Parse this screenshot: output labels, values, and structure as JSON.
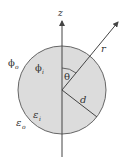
{
  "diagram": {
    "type": "sphere-in-dielectric",
    "colors": {
      "sphere_fill": "#dcdcdc",
      "stroke": "#555555",
      "text": "#333333"
    },
    "labels": {
      "z_axis": "z",
      "r_vector": "r",
      "theta": "θ",
      "radius": "d",
      "phi_outside": "ϕ",
      "phi_outside_sub": "o",
      "phi_inside": "ϕ",
      "phi_inside_sub": "i",
      "eps_inside": "ε",
      "eps_inside_sub": "i",
      "eps_outside": "ε",
      "eps_outside_sub": "o"
    }
  }
}
